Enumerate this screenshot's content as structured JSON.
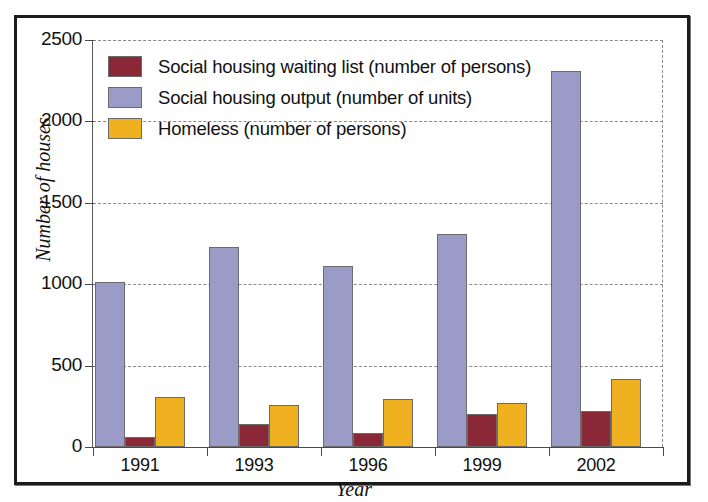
{
  "chart_data": {
    "type": "bar",
    "title": "",
    "xlabel": "Year",
    "ylabel": "Number of houses",
    "categories": [
      "1991",
      "1993",
      "1996",
      "1999",
      "2002"
    ],
    "ylim": [
      0,
      2500
    ],
    "yticks": [
      0,
      500,
      1000,
      1500,
      2000,
      2500
    ],
    "ytick_labels": [
      "0",
      "500",
      "1000",
      "1500",
      "2000",
      "2500"
    ],
    "grid": "horizontal-dashed",
    "legend_position": "top-left-inside",
    "series": [
      {
        "name": "Social housing waiting list (number of persons)",
        "color": "#8B2838",
        "values": [
          60,
          140,
          85,
          200,
          220
        ]
      },
      {
        "name": "Social housing output (number of units)",
        "color": "#9B9BC8",
        "values": [
          1015,
          1230,
          1110,
          1310,
          2310
        ]
      },
      {
        "name": "Homeless (number of persons)",
        "color": "#EFB120",
        "values": [
          310,
          260,
          295,
          270,
          420
        ]
      }
    ]
  },
  "legend": {
    "items": [
      {
        "label": "Social housing waiting list (number of persons)",
        "color": "#8B2838"
      },
      {
        "label": "Social housing output (number of units)",
        "color": "#9B9BC8"
      },
      {
        "label": "Homeless (number of persons)",
        "color": "#EFB120"
      }
    ]
  },
  "axes": {
    "y_title": "Number of houses",
    "x_title": "Year"
  }
}
